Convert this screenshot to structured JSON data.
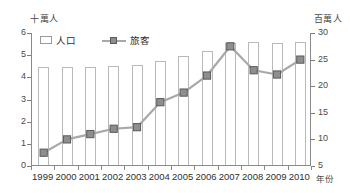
{
  "chart_data": {
    "type": "bar",
    "title": "",
    "xlabel": "年份",
    "categories": [
      "1999",
      "2000",
      "2001",
      "2002",
      "2003",
      "2004",
      "2005",
      "2006",
      "2007",
      "2008",
      "2009",
      "2010"
    ],
    "grid": false,
    "legend_position": "top-left",
    "axes": {
      "left": {
        "unit_label": "十萬人",
        "min": 0,
        "max": 6,
        "ticks": [
          "0",
          "1",
          "2",
          "3",
          "4",
          "5",
          "6"
        ],
        "series_name": "人口"
      },
      "right": {
        "unit_label": "百萬人",
        "min": 5,
        "max": 30,
        "ticks": [
          "5",
          "10",
          "15",
          "20",
          "25",
          "30"
        ],
        "series_name": "旅客"
      }
    },
    "series": [
      {
        "name": "人口",
        "kind": "bar",
        "axis": "left",
        "unit": "十萬人",
        "values": [
          4.4,
          4.4,
          4.4,
          4.45,
          4.5,
          4.7,
          4.9,
          5.15,
          5.5,
          5.55,
          5.5,
          5.55
        ]
      },
      {
        "name": "旅客",
        "kind": "line",
        "axis": "right",
        "unit": "百萬人",
        "marker": "square",
        "values": [
          7.5,
          10.0,
          11.0,
          12.0,
          12.3,
          17.0,
          18.8,
          22.0,
          27.5,
          23.0,
          22.2,
          25.0
        ]
      }
    ],
    "colors": {
      "bar_fill": "#ffffff",
      "bar_stroke": "#b9b9b9",
      "line": "#a8a8a8",
      "marker_fill": "#8e8e8e",
      "marker_stroke": "#5a5a5a",
      "axis": "#8a8a8a",
      "text": "#2f2f2f",
      "background": "#ffffff"
    }
  }
}
